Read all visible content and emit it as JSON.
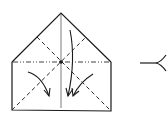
{
  "diagram": {
    "type": "origami-step",
    "colors": {
      "line": "#1a1a1a",
      "background": "#ffffff"
    },
    "shape": {
      "apex": [
        61,
        13
      ],
      "top_left": [
        12,
        62
      ],
      "top_right": [
        111,
        62
      ],
      "bottom_left": [
        12,
        110
      ],
      "bottom_right": [
        111,
        111
      ],
      "center": [
        61,
        62
      ]
    },
    "lines": [
      {
        "kind": "solid-outline",
        "desc": "house-shaped paper outline"
      },
      {
        "kind": "mountain-fold",
        "desc": "horizontal dash-dot line across the middle"
      },
      {
        "kind": "crease",
        "desc": "vertical center line"
      },
      {
        "kind": "valley-fold",
        "desc": "diagonal dashed line bottom-left to upper-right"
      },
      {
        "kind": "valley-fold",
        "desc": "diagonal dashed line upper-left to bottom-right"
      }
    ],
    "arrows": [
      {
        "desc": "curved arrow from left side pointing down-right"
      },
      {
        "desc": "long curved arrow from top pointing down"
      },
      {
        "desc": "arrow from right side pointing down-left"
      }
    ],
    "step_indicator": {
      "glyph": "<",
      "desc": "next-step pointer branching to the right"
    }
  }
}
